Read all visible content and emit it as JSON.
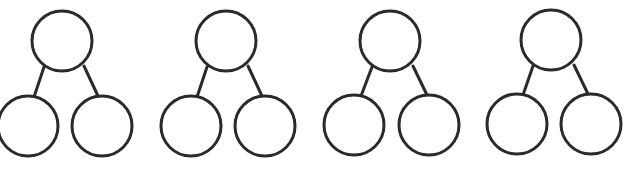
{
  "diagram": {
    "type": "number-bond-templates",
    "canvas": {
      "width": 624,
      "height": 171,
      "background": "#ffffff"
    },
    "stroke_color": "#2a2a2a",
    "node_radius": 30,
    "bonds": [
      {
        "id": "bond-1",
        "top": {
          "cx": 62,
          "cy": 41,
          "label": ""
        },
        "left": {
          "cx": 28,
          "cy": 126,
          "label": ""
        },
        "right": {
          "cx": 102,
          "cy": 126,
          "label": ""
        },
        "edges": [
          {
            "x1": 44,
            "y1": 67,
            "x2": 34,
            "y2": 97
          },
          {
            "x1": 84,
            "y1": 66,
            "x2": 98,
            "y2": 96
          }
        ]
      },
      {
        "id": "bond-2",
        "top": {
          "cx": 226,
          "cy": 41,
          "label": ""
        },
        "left": {
          "cx": 191,
          "cy": 126,
          "label": ""
        },
        "right": {
          "cx": 265,
          "cy": 126,
          "label": ""
        },
        "edges": [
          {
            "x1": 207,
            "y1": 67,
            "x2": 197,
            "y2": 97
          },
          {
            "x1": 248,
            "y1": 66,
            "x2": 262,
            "y2": 96
          }
        ]
      },
      {
        "id": "bond-3",
        "top": {
          "cx": 390,
          "cy": 41,
          "label": ""
        },
        "left": {
          "cx": 354,
          "cy": 125,
          "label": ""
        },
        "right": {
          "cx": 429,
          "cy": 125,
          "label": ""
        },
        "edges": [
          {
            "x1": 372,
            "y1": 67,
            "x2": 361,
            "y2": 96
          },
          {
            "x1": 413,
            "y1": 66,
            "x2": 427,
            "y2": 95
          }
        ]
      },
      {
        "id": "bond-4",
        "top": {
          "cx": 551,
          "cy": 40,
          "label": ""
        },
        "left": {
          "cx": 517,
          "cy": 124,
          "label": ""
        },
        "right": {
          "cx": 591,
          "cy": 124,
          "label": ""
        },
        "edges": [
          {
            "x1": 533,
            "y1": 66,
            "x2": 523,
            "y2": 95
          },
          {
            "x1": 574,
            "y1": 65,
            "x2": 588,
            "y2": 94
          }
        ]
      }
    ]
  }
}
